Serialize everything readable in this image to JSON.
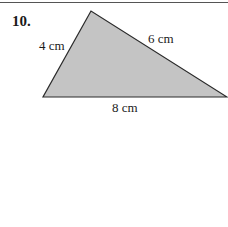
{
  "problem": {
    "number": "10.",
    "figure": "triangle",
    "sides": {
      "left": "4 cm",
      "right": "6 cm",
      "base": "8 cm"
    },
    "fill_color": "#c4c4c4",
    "stroke_color": "#2a2a2a"
  }
}
